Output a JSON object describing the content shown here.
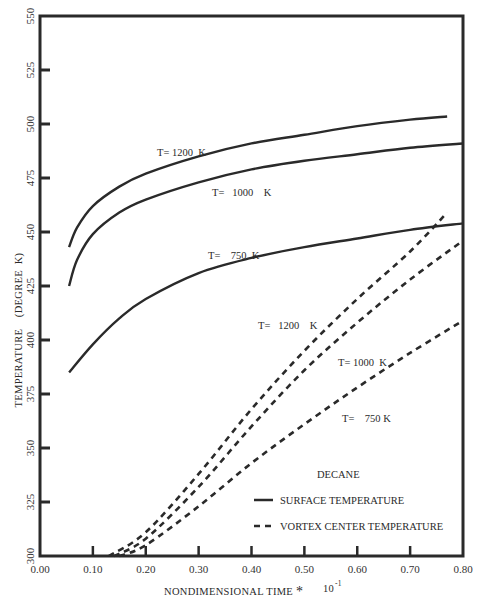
{
  "chart_data": {
    "type": "line",
    "title": "",
    "xlabel": "NONDIMENSIONAL TIME",
    "xlabel_multiplier": "*",
    "xlabel_exponent": "10",
    "xlabel_exponent_power": "-1",
    "ylabel": "TEMPERATURE    (DEGREE  K)",
    "xlim": [
      0.0,
      0.8
    ],
    "ylim": [
      300,
      550
    ],
    "grid": false,
    "legend_position": "lower right",
    "x_ticks": [
      "0.00",
      "0.10",
      "0.20",
      "0.30",
      "0.40",
      "0.50",
      "0.60",
      "0.70",
      "0.80"
    ],
    "y_ticks": [
      "300",
      "325",
      "350",
      "375",
      "400",
      "425",
      "450",
      "475",
      "500",
      "525",
      "550"
    ],
    "legend": {
      "title": "DECANE",
      "entries": [
        {
          "label": "SURFACE TEMPERATURE",
          "style": "solid"
        },
        {
          "label": "VORTEX CENTER TEMPERATURE",
          "style": "dashed"
        }
      ]
    },
    "series": [
      {
        "name": "Surface T=1200 K",
        "style": "solid",
        "x": [
          0.055,
          0.07,
          0.1,
          0.15,
          0.2,
          0.3,
          0.4,
          0.5,
          0.6,
          0.7,
          0.77
        ],
        "y": [
          443,
          452,
          462,
          471,
          477,
          485,
          491,
          495,
          499,
          502,
          503.5
        ]
      },
      {
        "name": "Surface T=1000 K",
        "style": "solid",
        "x": [
          0.055,
          0.07,
          0.1,
          0.15,
          0.2,
          0.3,
          0.4,
          0.5,
          0.6,
          0.7,
          0.8
        ],
        "y": [
          425,
          437,
          449,
          459,
          465,
          473,
          479,
          483,
          486,
          489,
          491
        ]
      },
      {
        "name": "Surface T=750 K",
        "style": "solid",
        "x": [
          0.055,
          0.1,
          0.15,
          0.2,
          0.3,
          0.4,
          0.5,
          0.6,
          0.7,
          0.8
        ],
        "y": [
          385,
          398,
          410,
          419,
          431,
          438,
          443,
          447,
          451,
          454
        ]
      },
      {
        "name": "Vortex T=1200 K",
        "style": "dashed",
        "x": [
          0.13,
          0.2,
          0.3,
          0.4,
          0.5,
          0.6,
          0.7,
          0.77
        ],
        "y": [
          300,
          311,
          338,
          368,
          395,
          419,
          441,
          459
        ]
      },
      {
        "name": "Vortex T=1000 K",
        "style": "dashed",
        "x": [
          0.14,
          0.2,
          0.3,
          0.4,
          0.5,
          0.6,
          0.7,
          0.8
        ],
        "y": [
          300,
          308,
          332,
          360,
          386,
          408,
          428,
          446
        ]
      },
      {
        "name": "Vortex T=750 K",
        "style": "dashed",
        "x": [
          0.15,
          0.2,
          0.3,
          0.4,
          0.5,
          0.6,
          0.7,
          0.8
        ],
        "y": [
          300,
          305,
          323,
          343,
          361,
          378,
          394,
          409
        ]
      }
    ],
    "annotations": [
      {
        "text": "T= 1200  K",
        "near": "Surface T=1200 K"
      },
      {
        "text": "T=   1000    K",
        "near": "Surface T=1000 K"
      },
      {
        "text": "T=    750  K",
        "near": "Surface T=750 K"
      },
      {
        "text": "T=   1200    K",
        "near": "Vortex T=1200 K"
      },
      {
        "text": "T= 1000  K",
        "near": "Vortex T=1000 K"
      },
      {
        "text": "T=    750 K",
        "near": "Vortex T=750 K"
      }
    ]
  },
  "labels": {
    "surface_1200": "T= 1200  K",
    "surface_1000": "T=   1000    K",
    "surface_750": "T=    750  K",
    "vortex_1200": "T=   1200    K",
    "vortex_1000": "T= 1000  K",
    "vortex_750": "T=    750 K"
  }
}
